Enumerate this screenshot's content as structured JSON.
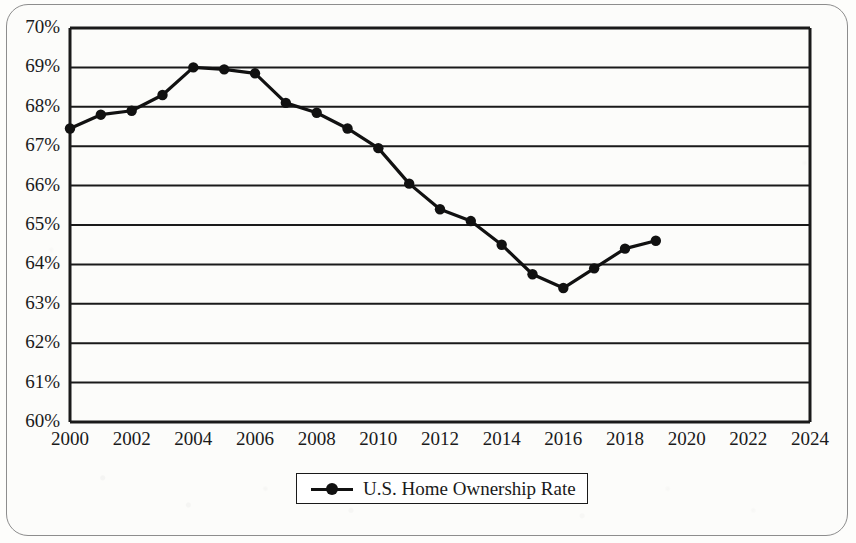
{
  "chart_data": {
    "type": "line",
    "title": "",
    "subtitle": "",
    "xlabel": "",
    "ylabel": "",
    "grid": true,
    "legend_position": "bottom",
    "xlim": [
      2000,
      2024
    ],
    "ylim": [
      60,
      70
    ],
    "x_tick_labels": [
      "2000",
      "2002",
      "2004",
      "2006",
      "2008",
      "2010",
      "2012",
      "2014",
      "2016",
      "2018",
      "2020",
      "2022",
      "2024"
    ],
    "x_tick_values": [
      2000,
      2002,
      2004,
      2006,
      2008,
      2010,
      2012,
      2014,
      2016,
      2018,
      2020,
      2022,
      2024
    ],
    "y_tick_labels": [
      "70%",
      "69%",
      "68%",
      "67%",
      "66%",
      "65%",
      "64%",
      "63%",
      "62%",
      "61%",
      "60%"
    ],
    "y_tick_values": [
      70,
      69,
      68,
      67,
      66,
      65,
      64,
      63,
      62,
      61,
      60
    ],
    "series": [
      {
        "name": "U.S. Home Ownership Rate",
        "color": "#111111",
        "marker": "circle",
        "x": [
          2000,
          2001,
          2002,
          2003,
          2004,
          2005,
          2006,
          2007,
          2008,
          2009,
          2010,
          2011,
          2012,
          2013,
          2014,
          2015,
          2016,
          2017,
          2018,
          2019
        ],
        "values": [
          67.45,
          67.8,
          67.9,
          68.3,
          69.0,
          68.95,
          68.85,
          68.1,
          67.85,
          67.45,
          66.95,
          66.05,
          65.4,
          65.1,
          64.5,
          63.75,
          63.4,
          63.9,
          64.4,
          64.6
        ]
      }
    ]
  },
  "legend": {
    "entries": [
      {
        "label": "U.S. Home Ownership Rate",
        "symbol": "line-marker-symbol"
      }
    ]
  },
  "axes": {
    "y_unit": "percent",
    "x_unit": "year"
  }
}
